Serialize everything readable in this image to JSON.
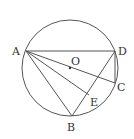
{
  "diagram": {
    "type": "geometry",
    "stroke_color": "#555555",
    "circle": {
      "center": "O",
      "cx": 70,
      "cy": 68,
      "r": 48
    },
    "points": {
      "A": {
        "x": 26,
        "y": 51,
        "label": "A",
        "lx": 12,
        "ly": 55
      },
      "D": {
        "x": 115,
        "y": 51,
        "label": "D",
        "lx": 118,
        "ly": 55
      },
      "C": {
        "x": 115,
        "y": 83,
        "label": "C",
        "lx": 117,
        "ly": 91
      },
      "B": {
        "x": 72,
        "y": 116,
        "label": "B",
        "lx": 67,
        "ly": 131
      },
      "O": {
        "x": 70,
        "y": 68,
        "label": "O",
        "lx": 71,
        "ly": 65
      },
      "E": {
        "x": 89,
        "y": 95,
        "label": "E",
        "lx": 90,
        "ly": 106
      }
    },
    "segments": [
      [
        "A",
        "D"
      ],
      [
        "A",
        "C"
      ],
      [
        "A",
        "E"
      ],
      [
        "A",
        "B"
      ],
      [
        "D",
        "C"
      ],
      [
        "D",
        "B"
      ]
    ]
  }
}
